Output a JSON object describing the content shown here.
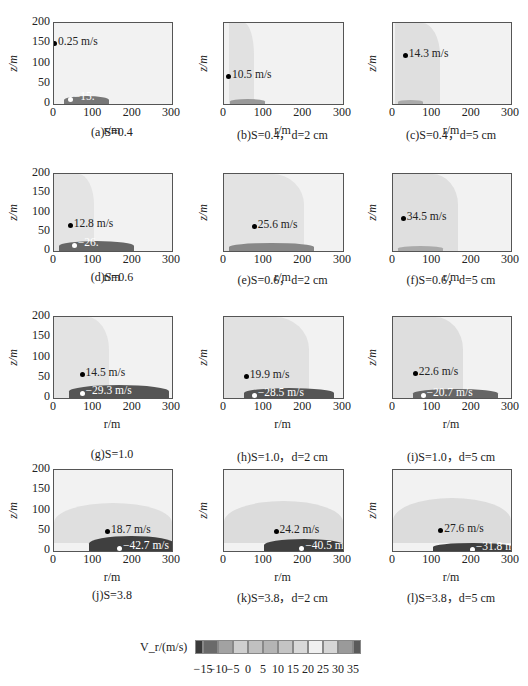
{
  "figure": {
    "x_axis_label": "r/m",
    "y_axis_label": "z/m",
    "x_ticks": [
      "0",
      "100",
      "200",
      "300"
    ],
    "y_ticks": [
      "0",
      "50",
      "100",
      "150",
      "200"
    ]
  },
  "panels": [
    {
      "caption": "(a)S=0.4",
      "max_label": "0.25 m/s",
      "min_label": "−15.",
      "show_yticks": true
    },
    {
      "caption": "(b)S=0.4，d=2 cm",
      "max_label": "10.5 m/s",
      "min_label": "",
      "show_yticks": false
    },
    {
      "caption": "(c)S=0.4，d=5 cm",
      "max_label": "14.3 m/s",
      "min_label": "",
      "show_yticks": false
    },
    {
      "caption": "(d)S=0.6",
      "max_label": "12.8 m/s",
      "min_label": "−26.",
      "show_yticks": true
    },
    {
      "caption": "(e)S=0.6，d=2 cm",
      "max_label": "25.6 m/s",
      "min_label": "",
      "show_yticks": false
    },
    {
      "caption": "(f)S=0.6，d=5 cm",
      "max_label": "34.5 m/s",
      "min_label": "",
      "show_yticks": false
    },
    {
      "caption": "(g)S=1.0",
      "max_label": "14.5 m/s",
      "min_label": "−29.3 m/s",
      "show_yticks": true
    },
    {
      "caption": "(h)S=1.0，d=2 cm",
      "max_label": "19.9 m/s",
      "min_label": "−28.5 m/s",
      "show_yticks": false
    },
    {
      "caption": "(i)S=1.0，d=5 cm",
      "max_label": "22.6 m/s",
      "min_label": "−20.7 m/s",
      "show_yticks": false
    },
    {
      "caption": "(j)S=3.8",
      "max_label": "18.7 m/s",
      "min_label": "−42.7 m/s",
      "show_yticks": true
    },
    {
      "caption": "(k)S=3.8，d=2 cm",
      "max_label": "24.2 m/s",
      "min_label": "−40.5 m/s",
      "show_yticks": false
    },
    {
      "caption": "(l)S=3.8，d=5 cm",
      "max_label": "27.6 m/s",
      "min_label": "−31.8 m/s",
      "show_yticks": false
    }
  ],
  "legend": {
    "title": "V_r/(m/s)",
    "ticks": [
      "−15",
      "−10",
      "−5",
      "0",
      "5",
      "10",
      "15",
      "20",
      "25",
      "30",
      "35"
    ],
    "colors": [
      "#3a3a3a",
      "#6a6a6a",
      "#a2a2a2",
      "#cfcfcf",
      "#c0c0c0",
      "#b4b4b4",
      "#c4c4c4",
      "#d8d8d8",
      "#f0f0f0",
      "#d6d6d6",
      "#9a9a9a",
      "#5a5a5a"
    ]
  },
  "chart_data": {
    "type": "heatmap",
    "xlabel": "r/m",
    "ylabel": "z/m",
    "xlim": [
      0,
      300
    ],
    "ylim": [
      0,
      200
    ],
    "colorbar": {
      "label": "V_r/(m/s)",
      "ticks": [
        -15,
        -10,
        -5,
        0,
        5,
        10,
        15,
        20,
        25,
        30,
        35
      ]
    },
    "series": [
      {
        "name": "(a)S=0.4",
        "max": {
          "r": 0,
          "z": 150,
          "v": 0.25
        },
        "min": {
          "r": 40,
          "z": 10,
          "v": -15
        }
      },
      {
        "name": "(b)S=0.4, d=2 cm",
        "max": {
          "r": 10,
          "z": 70,
          "v": 10.5
        }
      },
      {
        "name": "(c)S=0.4, d=5 cm",
        "max": {
          "r": 30,
          "z": 120,
          "v": 14.3
        }
      },
      {
        "name": "(d)S=0.6",
        "max": {
          "r": 40,
          "z": 68,
          "v": 12.8
        },
        "min": {
          "r": 50,
          "z": 12,
          "v": -26
        }
      },
      {
        "name": "(e)S=0.6, d=2 cm",
        "max": {
          "r": 75,
          "z": 65,
          "v": 25.6
        }
      },
      {
        "name": "(f)S=0.6, d=5 cm",
        "max": {
          "r": 25,
          "z": 85,
          "v": 34.5
        }
      },
      {
        "name": "(g)S=1.0",
        "max": {
          "r": 70,
          "z": 60,
          "v": 14.5
        },
        "min": {
          "r": 70,
          "z": 10,
          "v": -29.3
        }
      },
      {
        "name": "(h)S=1.0, d=2 cm",
        "max": {
          "r": 55,
          "z": 55,
          "v": 19.9
        },
        "min": {
          "r": 75,
          "z": 5,
          "v": -28.5
        }
      },
      {
        "name": "(i)S=1.0, d=5 cm",
        "max": {
          "r": 55,
          "z": 62,
          "v": 22.6
        },
        "min": {
          "r": 75,
          "z": 5,
          "v": -20.7
        }
      },
      {
        "name": "(j)S=3.8",
        "max": {
          "r": 135,
          "z": 50,
          "v": 18.7
        },
        "min": {
          "r": 165,
          "z": 5,
          "v": -42.7
        }
      },
      {
        "name": "(k)S=3.8, d=2 cm",
        "max": {
          "r": 130,
          "z": 50,
          "v": 24.2
        },
        "min": {
          "r": 195,
          "z": 5,
          "v": -40.5
        }
      },
      {
        "name": "(l)S=3.8, d=5 cm",
        "max": {
          "r": 120,
          "z": 52,
          "v": 27.6
        },
        "min": {
          "r": 200,
          "z": 3,
          "v": -31.8
        }
      }
    ]
  }
}
